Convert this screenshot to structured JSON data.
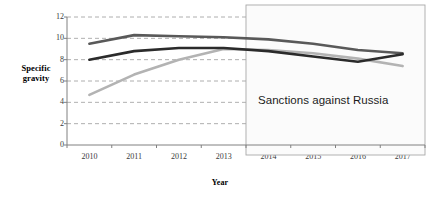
{
  "chart_data": {
    "type": "line",
    "title": "",
    "subtitle": "",
    "xlabel": "Year",
    "ylabel": "Specific gravity",
    "categories": [
      "2010",
      "2011",
      "2012",
      "2013",
      "2014",
      "2015",
      "2016",
      "2017"
    ],
    "x": [
      2010,
      2011,
      2012,
      2013,
      2014,
      2015,
      2016,
      2017
    ],
    "ylim": [
      0,
      12
    ],
    "yticks": [
      0,
      2,
      4,
      6,
      8,
      10,
      12
    ],
    "ytick_labels": [
      "0",
      "2",
      "4",
      "6",
      "8",
      "10",
      "12"
    ],
    "grid": "horizontal-dashed",
    "legend": "none",
    "series": [
      {
        "name": "series-1",
        "color": "#595959",
        "values": [
          9.5,
          10.3,
          10.2,
          10.1,
          9.9,
          9.5,
          8.9,
          8.6
        ]
      },
      {
        "name": "series-2",
        "color": "#2b2b2b",
        "values": [
          8.0,
          8.8,
          9.1,
          9.1,
          8.8,
          8.3,
          7.8,
          8.5
        ]
      },
      {
        "name": "series-3",
        "color": "#b3b3b3",
        "values": [
          4.7,
          6.6,
          8.0,
          9.0,
          8.9,
          8.6,
          8.1,
          7.4
        ]
      }
    ],
    "annotations": [
      {
        "name": "sanctions-region",
        "text": "Sanctions against Russia",
        "x_start": "2013.5",
        "x_end": "2017.6",
        "type": "shaded-box"
      }
    ]
  },
  "axis": {
    "y_title": "Specific\ngravity",
    "y_title_line1": "Specific",
    "y_title_line2": "gravity",
    "x_title": "Year"
  },
  "colors": {
    "series_1": "#595959",
    "series_2": "#2b2b2b",
    "series_3": "#b3b3b3",
    "grid": "#9a9a9a",
    "axis": "#808080",
    "box_border": "#a8a8a8",
    "background": "#ffffff",
    "text": "#1a1a1a"
  }
}
